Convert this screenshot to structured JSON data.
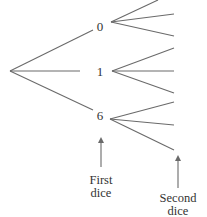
{
  "diagram": {
    "type": "tree",
    "root": {
      "x": 10,
      "y": 71
    },
    "first_level": [
      {
        "label": "0",
        "branch_end": {
          "x": 93,
          "y": 30
        },
        "label_pos": {
          "x": 100,
          "y": 31
        },
        "node": {
          "x": 111,
          "y": 22
        },
        "children": [
          {
            "x": 158,
            "y": 0
          },
          {
            "x": 174,
            "y": 14
          },
          {
            "x": 174,
            "y": 36
          }
        ]
      },
      {
        "label": "1",
        "branch_end": {
          "x": 80,
          "y": 71
        },
        "label_pos": {
          "x": 100,
          "y": 76
        },
        "node": {
          "x": 112,
          "y": 71
        },
        "children": [
          {
            "x": 174,
            "y": 48
          },
          {
            "x": 174,
            "y": 71
          },
          {
            "x": 174,
            "y": 93
          }
        ]
      },
      {
        "label": "6",
        "branch_end": {
          "x": 93,
          "y": 110
        },
        "label_pos": {
          "x": 100,
          "y": 120
        },
        "node": {
          "x": 110,
          "y": 119
        },
        "children": [
          {
            "x": 174,
            "y": 102
          },
          {
            "x": 174,
            "y": 125
          },
          {
            "x": 174,
            "y": 150
          }
        ]
      }
    ],
    "annotations": [
      {
        "lines": [
          "First",
          "dice"
        ],
        "arrow_x": 101,
        "arrow_from_y": 167,
        "arrow_to_y": 139,
        "text_x": 101,
        "text_y": [
          184,
          197
        ]
      },
      {
        "lines": [
          "Second",
          "dice"
        ],
        "arrow_x": 178,
        "arrow_from_y": 188,
        "arrow_to_y": 157,
        "text_x": 178,
        "text_y": [
          202,
          215
        ]
      }
    ],
    "colors": {
      "line": "#6a6a6a",
      "text": "#333333"
    }
  },
  "labels": {
    "node_0": "0",
    "node_1": "1",
    "node_6": "6",
    "first_dice_line1": "First",
    "first_dice_line2": "dice",
    "second_dice_line1": "Second",
    "second_dice_line2": "dice"
  }
}
